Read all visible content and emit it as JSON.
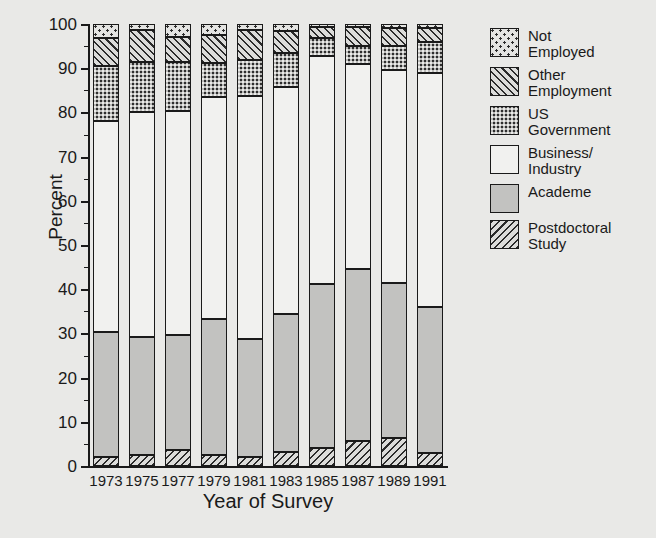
{
  "chart_data": {
    "type": "bar",
    "subtype": "stacked-bar-100",
    "title": "",
    "xlabel": "Year of Survey",
    "ylabel": "Percent",
    "ylim": [
      0,
      100
    ],
    "ytick_step": 10,
    "yticks": [
      0,
      10,
      20,
      30,
      40,
      50,
      60,
      70,
      80,
      90,
      100
    ],
    "ytick_labels": [
      "0",
      "10",
      "20",
      "30",
      "40",
      "50",
      "60",
      "70",
      "80",
      "90",
      "100"
    ],
    "minor_tick_step": 5,
    "grid": false,
    "legend_position": "right",
    "categories": [
      "1973",
      "1975",
      "1977",
      "1979",
      "1981",
      "1983",
      "1985",
      "1987",
      "1989",
      "1991"
    ],
    "series": [
      {
        "name": "Postdoctoral Study",
        "pattern": "diagonal-hatch-backward",
        "color": "#dcdcda",
        "values": [
          2.0,
          2.5,
          3.6,
          2.4,
          2.0,
          3.2,
          4.0,
          5.6,
          6.3,
          3.0
        ]
      },
      {
        "name": "Academe",
        "pattern": "solid-gray",
        "color": "#c2c2c0",
        "values": [
          28.3,
          26.7,
          26.0,
          30.9,
          26.8,
          31.1,
          37.2,
          38.9,
          35.0,
          33.0
        ]
      },
      {
        "name": "Business/Industry",
        "pattern": "empty-white",
        "color": "#f1f1ef",
        "values": [
          47.7,
          50.8,
          50.8,
          50.3,
          55.0,
          51.5,
          51.6,
          46.4,
          48.2,
          52.9
        ]
      },
      {
        "name": "US Government",
        "pattern": "dense-checkerboard",
        "color": "#2e2e2e",
        "values": [
          12.5,
          11.3,
          11.0,
          7.6,
          8.0,
          7.7,
          4.0,
          4.1,
          5.5,
          7.0
        ]
      },
      {
        "name": "Other Employment",
        "pattern": "diagonal-hatch-forward",
        "color": "#dcdcda",
        "values": [
          6.3,
          7.4,
          5.6,
          6.3,
          6.9,
          5.0,
          2.5,
          4.4,
          4.1,
          3.1
        ]
      },
      {
        "name": "Not Employed",
        "pattern": "sparse-dots",
        "color": "#e4e4e2",
        "values": [
          3.2,
          1.3,
          3.0,
          2.5,
          1.3,
          1.5,
          0.7,
          0.6,
          0.9,
          1.0
        ]
      }
    ],
    "cumulative_tops": {
      "1973": [
        2.0,
        30.3,
        78.0,
        90.5,
        96.8,
        100.0
      ],
      "1975": [
        2.5,
        29.2,
        80.0,
        91.3,
        98.7,
        100.0
      ],
      "1977": [
        3.6,
        29.6,
        80.4,
        91.4,
        97.0,
        100.0
      ],
      "1979": [
        2.4,
        33.3,
        83.6,
        91.2,
        97.5,
        100.0
      ],
      "1981": [
        2.0,
        28.8,
        83.8,
        91.8,
        98.7,
        100.0
      ],
      "1983": [
        3.2,
        34.3,
        85.8,
        93.5,
        98.5,
        100.0
      ],
      "1985": [
        4.0,
        41.2,
        92.8,
        96.8,
        99.3,
        100.0
      ],
      "1987": [
        5.6,
        44.5,
        90.9,
        95.0,
        99.4,
        100.0
      ],
      "1989": [
        6.3,
        41.3,
        89.5,
        95.0,
        99.1,
        100.0
      ],
      "1991": [
        3.0,
        36.0,
        88.9,
        95.9,
        99.0,
        100.0
      ]
    }
  },
  "legend": {
    "items": [
      {
        "label": "Not\nEmployed",
        "swatch": "sparse-dots"
      },
      {
        "label": "Other\nEmployment",
        "swatch": "diagonal-hatch-forward"
      },
      {
        "label": "US\nGovernment",
        "swatch": "dense-checkerboard"
      },
      {
        "label": "Business/\nIndustry",
        "swatch": "empty-white"
      },
      {
        "label": "Academe",
        "swatch": "solid-gray"
      },
      {
        "label": "Postdoctoral\nStudy",
        "swatch": "diagonal-hatch-backward"
      }
    ]
  },
  "colors": {
    "background": "#e9e9e7",
    "ink": "#1a1a1a",
    "academe": "#c2c2c0",
    "business": "#f1f1ef",
    "usgov": "#2e2e2e"
  }
}
